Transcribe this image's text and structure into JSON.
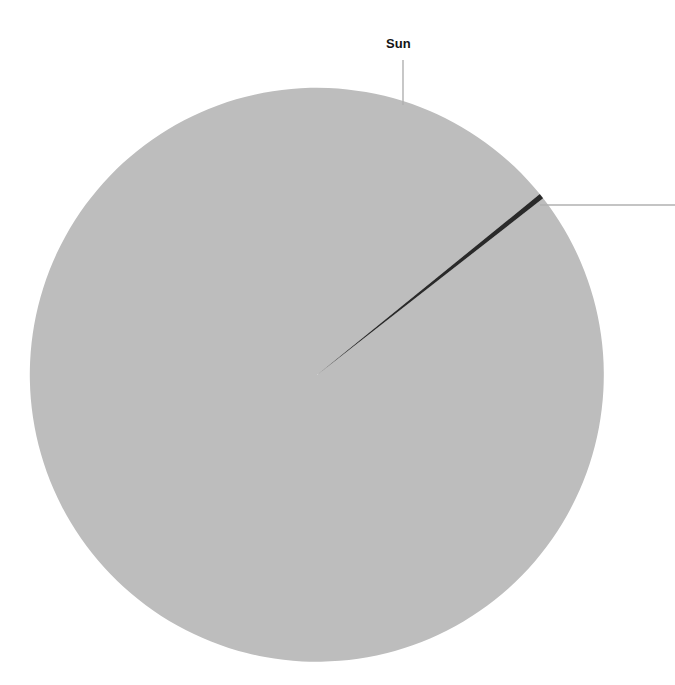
{
  "figure": {
    "background_color": "#ffffff",
    "width": 675,
    "height": 685
  },
  "labels": {
    "sun": "Sun",
    "secondary": ""
  },
  "colors": {
    "major_slice": "#bdbdbd",
    "minor_slice": "#2a2a2a",
    "leader_line": "#b0b0b0",
    "label_text": "#141414"
  },
  "chart_data": {
    "type": "pie",
    "title": "",
    "legend": "none",
    "center": [
      317,
      375
    ],
    "radius": 287,
    "start_angle_deg": 52.0,
    "direction": "clockwise",
    "categories": [
      "Sun",
      ""
    ],
    "values": [
      99.7,
      0.3
    ],
    "value_unit": "percent",
    "labels_shown": [
      "Sun"
    ],
    "annotations": [
      {
        "text": "Sun",
        "leader": "vertical",
        "anchor_x": 403,
        "anchor_y": 105,
        "label_x": 403,
        "label_y": 60
      },
      {
        "text": "",
        "leader": "horizontal",
        "anchor_x": 540,
        "anchor_y": 205,
        "label_x": 690,
        "label_y": 205
      }
    ]
  }
}
